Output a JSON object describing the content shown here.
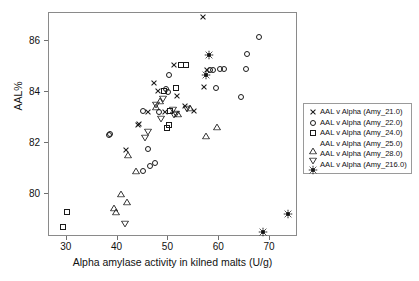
{
  "chart_data": {
    "type": "scatter",
    "title": "",
    "xlabel": "Alpha amylase activity in kilned malts (U/g)",
    "ylabel": "AAL%",
    "xlim": [
      26.5,
      75.5
    ],
    "ylim": [
      78.3,
      87.1
    ],
    "xticks": [
      30,
      40,
      50,
      60,
      70
    ],
    "yticks": [
      80,
      82,
      84,
      86
    ],
    "grid": false,
    "legend_position": "right",
    "frame": true,
    "series": [
      {
        "name": "AAL v Alpha (Amy_21.0)",
        "marker": "cross",
        "filled": false,
        "color": "#1a1a1a",
        "points": [
          [
            56.8,
            86.95
          ],
          [
            47.1,
            84.35
          ],
          [
            48.0,
            84.05
          ],
          [
            51.0,
            85.05
          ],
          [
            41.6,
            81.7
          ],
          [
            51.6,
            83.85
          ],
          [
            57.0,
            84.2
          ],
          [
            55.0,
            83.25
          ],
          [
            44.2,
            82.75
          ],
          [
            49.3,
            83.2
          ],
          [
            44.0,
            82.7
          ],
          [
            57.6,
            84.85
          ],
          [
            53.3,
            83.45
          ],
          [
            46.0,
            83.2
          ]
        ]
      },
      {
        "name": "AAL v Alpha (Amy_22.0)",
        "marker": "circle",
        "filled": false,
        "color": "#1a1a1a",
        "points": [
          [
            67.8,
            86.15
          ],
          [
            65.4,
            85.5
          ],
          [
            65.3,
            84.9
          ],
          [
            61.0,
            84.9
          ],
          [
            60.2,
            84.9
          ],
          [
            58.8,
            84.85
          ],
          [
            58.2,
            84.85
          ],
          [
            64.2,
            83.8
          ],
          [
            59.3,
            84.15
          ],
          [
            50.2,
            84.65
          ],
          [
            49.5,
            84.1
          ],
          [
            49.9,
            84.0
          ],
          [
            46.0,
            81.75
          ],
          [
            47.3,
            81.2
          ],
          [
            46.3,
            81.1
          ],
          [
            45.0,
            80.9
          ],
          [
            38.3,
            82.3
          ],
          [
            38.5,
            82.35
          ],
          [
            48.2,
            83.2
          ],
          [
            44.9,
            83.25
          ]
        ]
      },
      {
        "name": "AAL v Alpha (Amy_24.0)",
        "marker": "square",
        "filled": false,
        "color": "#1a1a1a",
        "points": [
          [
            30.0,
            79.3
          ],
          [
            29.3,
            78.7
          ],
          [
            51.5,
            84.15
          ],
          [
            53.5,
            85.05
          ],
          [
            49.8,
            82.6
          ],
          [
            50.2,
            82.7
          ],
          [
            50.3,
            83.25
          ],
          [
            49.2,
            84.05
          ],
          [
            52.5,
            85.05
          ]
        ]
      },
      {
        "name": "AAL v Alpha (Amy_25.0)",
        "marker": "triangle-up",
        "filled": false,
        "color": "#1a1a1a",
        "points": [
          [
            42.0,
            81.8
          ],
          [
            43.7,
            81.15
          ],
          [
            40.6,
            80.25
          ],
          [
            41.9,
            79.95
          ],
          [
            39.3,
            79.7
          ],
          [
            39.6,
            79.55
          ],
          [
            51.8,
            83.4
          ],
          [
            47.5,
            83.7
          ],
          [
            59.6,
            82.9
          ],
          [
            57.3,
            82.55
          ],
          [
            54.2,
            83.65
          ],
          [
            48.3,
            83.9
          ]
        ]
      },
      {
        "name": "AAL v Alpha (Amy_28.0)",
        "marker": "triangle-down",
        "filled": false,
        "color": "#1a1a1a",
        "points": [
          [
            41.4,
            79.1
          ],
          [
            45.3,
            82.45
          ],
          [
            46.0,
            82.7
          ],
          [
            47.6,
            83.75
          ],
          [
            49.0,
            84.0
          ],
          [
            50.9,
            83.55
          ],
          [
            51.4,
            83.4
          ],
          [
            53.6,
            83.6
          ],
          [
            51.0,
            83.35
          ],
          [
            48.6,
            83.2
          ]
        ]
      },
      {
        "name": "AAL v Alpha (Amy_216.0)",
        "marker": "filled-square",
        "filled": true,
        "color": "#111111",
        "points": [
          [
            57.9,
            85.65
          ],
          [
            57.4,
            84.85
          ],
          [
            73.6,
            79.4
          ],
          [
            68.6,
            78.7
          ]
        ]
      }
    ]
  },
  "axes": {
    "xlabel": "Alpha amylase activity in kilned malts (U/g)",
    "ylabel": "AAL%",
    "xticklabels": [
      "30",
      "40",
      "50",
      "60",
      "70"
    ],
    "yticklabels": [
      "80",
      "82",
      "84",
      "86"
    ]
  },
  "legend": {
    "entries": [
      {
        "label": "AAL v Alpha (Amy_21.0)",
        "marker": "cross"
      },
      {
        "label": "AAL v Alpha (Amy_22.0)",
        "marker": "circle"
      },
      {
        "label": "AAL v Alpha (Amy_24.0)",
        "marker": "square"
      },
      {
        "label": "AAL v Alpha (Amy_25.0)",
        "marker": "triangle-up"
      },
      {
        "label": "AAL v Alpha (Amy_28.0)",
        "marker": "triangle-down"
      },
      {
        "label": "AAL v Alpha (Amy_216.0)",
        "marker": "filled-square"
      }
    ]
  },
  "colors": {
    "marker": "#1a1a1a",
    "frame": "#8a8a8a",
    "text": "#111111",
    "background": "#ffffff"
  }
}
